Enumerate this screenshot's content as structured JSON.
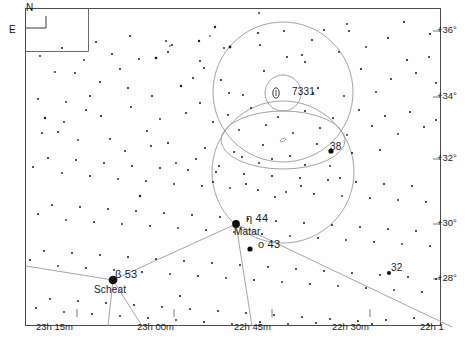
{
  "chart_data": {
    "type": "scatter",
    "xlabel": "Right Ascension",
    "ylabel": "Declination",
    "grid": false,
    "legend": "none",
    "x_ticks": [
      {
        "label": "23h 15m",
        "x": 63
      },
      {
        "label": "23h 00m",
        "x": 167
      },
      {
        "label": "22h 45m",
        "x": 265
      },
      {
        "label": "22h 30m",
        "x": 362
      },
      {
        "label": "22h 1",
        "x": 443
      }
    ],
    "y_ticks": [
      {
        "label": "+36°",
        "y": 27
      },
      {
        "label": "+34°",
        "y": 93
      },
      {
        "label": "+32°",
        "y": 155
      },
      {
        "label": "+30°",
        "y": 220
      },
      {
        "label": "+28°",
        "y": 275
      }
    ],
    "annotations": [
      {
        "name": "ngc-7331",
        "label": "7331",
        "x": 292,
        "y": 93,
        "kind": "galaxy"
      },
      {
        "name": "star-38",
        "label": "38",
        "x": 336,
        "y": 148,
        "kind": "star"
      },
      {
        "name": "star-eta-44",
        "label": "η  44",
        "x": 252,
        "y": 219,
        "kind": "star"
      },
      {
        "name": "star-matar",
        "label": "Matar",
        "x": 240,
        "y": 233,
        "kind": "proper-name"
      },
      {
        "name": "star-omicron-43",
        "label": "ο  43",
        "x": 263,
        "y": 245,
        "kind": "star"
      },
      {
        "name": "star-beta-53",
        "label": "β  53",
        "x": 120,
        "y": 275,
        "kind": "star"
      },
      {
        "name": "star-scheat",
        "label": "Scheat",
        "x": 98,
        "y": 292,
        "kind": "proper-name"
      },
      {
        "name": "star-32",
        "label": "32",
        "x": 396,
        "y": 269,
        "kind": "star"
      }
    ],
    "fov_circles": [
      {
        "name": "outer-circle-upper",
        "cx": 283,
        "cy": 92,
        "r": 70
      },
      {
        "name": "inner-circle-ngc7331",
        "cx": 283,
        "cy": 93,
        "r": 18
      },
      {
        "name": "outer-circle-lower",
        "cx": 283,
        "cy": 172,
        "r": 71
      },
      {
        "name": "ellipse-field",
        "cx": 283,
        "cy": 140,
        "rx": 62,
        "ry": 29
      }
    ],
    "named_stars": [
      {
        "name": "NGC 7331",
        "x": 283,
        "y": 93,
        "mag": 9.5,
        "type": "galaxy"
      },
      {
        "name": "38 Peg",
        "x": 331,
        "y": 151,
        "mag": 5.6,
        "type": "star"
      },
      {
        "name": "eta Peg / Matar / 44 Peg",
        "x": 236,
        "y": 224,
        "mag": 2.9,
        "type": "star"
      },
      {
        "name": "omicron Peg / 43 Peg",
        "x": 250,
        "y": 249,
        "mag": 4.8,
        "type": "star"
      },
      {
        "name": "beta Peg / Scheat / 53 Peg",
        "x": 113,
        "y": 280,
        "mag": 2.4,
        "type": "star"
      },
      {
        "name": "32 Peg",
        "x": 389,
        "y": 273,
        "mag": 4.8,
        "type": "star"
      }
    ]
  },
  "compass": {
    "north_label": "N",
    "east_label": "E"
  },
  "stars": [
    [
      215,
      27,
      1.2
    ],
    [
      258,
      33,
      1.1
    ],
    [
      324,
      30,
      1.0
    ],
    [
      404,
      22,
      1.1
    ],
    [
      444,
      26,
      1.0
    ],
    [
      519,
      28,
      0.9
    ],
    [
      224,
      48,
      0.9
    ],
    [
      260,
      45,
      1.0
    ],
    [
      210,
      36,
      0.8
    ],
    [
      388,
      38,
      1.1
    ],
    [
      347,
      24,
      0.9
    ],
    [
      156,
      58,
      1.3
    ],
    [
      139,
      59,
      1.0
    ],
    [
      302,
      55,
      1.0
    ],
    [
      339,
      52,
      0.9
    ],
    [
      430,
      34,
      1.1
    ],
    [
      204,
      68,
      1.0
    ],
    [
      264,
      71,
      1.0
    ],
    [
      366,
      47,
      0.9
    ],
    [
      259,
      13,
      0.9
    ],
    [
      193,
      78,
      1.0
    ],
    [
      181,
      86,
      1.2
    ],
    [
      172,
      45,
      1.0
    ],
    [
      253,
      8,
      0.9
    ],
    [
      23,
      71,
      1.2
    ],
    [
      75,
      73,
      1.0
    ],
    [
      120,
      69,
      1.0
    ],
    [
      55,
      72,
      0.9
    ],
    [
      199,
      41,
      1.2
    ],
    [
      166,
      41,
      0.9
    ],
    [
      168,
      52,
      1.0
    ],
    [
      170,
      46,
      0.8
    ],
    [
      229,
      93,
      1.0
    ],
    [
      243,
      95,
      1.0
    ],
    [
      287,
      57,
      1.0
    ],
    [
      305,
      62,
      1.0
    ],
    [
      318,
      88,
      1.1
    ],
    [
      313,
      93,
      1.0
    ],
    [
      344,
      96,
      0.9
    ],
    [
      349,
      31,
      1.0
    ],
    [
      361,
      69,
      1.1
    ],
    [
      376,
      92,
      0.9
    ],
    [
      391,
      79,
      1.0
    ],
    [
      407,
      60,
      1.1
    ],
    [
      416,
      73,
      1.0
    ],
    [
      429,
      57,
      1.0
    ],
    [
      440,
      60,
      0.9
    ],
    [
      446,
      119,
      2.2
    ],
    [
      448,
      58,
      1.2
    ],
    [
      454,
      44,
      0.9
    ],
    [
      436,
      83,
      1.0
    ],
    [
      444,
      91,
      1.0
    ],
    [
      441,
      100,
      0.9
    ],
    [
      22,
      72,
      1.1
    ],
    [
      38,
      99,
      1.0
    ],
    [
      66,
      102,
      0.9
    ],
    [
      90,
      96,
      1.0
    ],
    [
      101,
      116,
      1.1
    ],
    [
      45,
      118,
      1.2
    ],
    [
      58,
      132,
      1.0
    ],
    [
      78,
      140,
      0.9
    ],
    [
      110,
      139,
      1.0
    ],
    [
      131,
      107,
      1.0
    ],
    [
      147,
      131,
      1.0
    ],
    [
      160,
      119,
      0.9
    ],
    [
      186,
      113,
      1.0
    ],
    [
      200,
      103,
      1.0
    ],
    [
      213,
      122,
      1.0
    ],
    [
      228,
      115,
      1.0
    ],
    [
      239,
      130,
      0.9
    ],
    [
      251,
      108,
      1.0
    ],
    [
      266,
      125,
      1.0
    ],
    [
      278,
      117,
      1.0
    ],
    [
      293,
      133,
      0.9
    ],
    [
      305,
      111,
      1.0
    ],
    [
      320,
      128,
      1.0
    ],
    [
      333,
      118,
      1.0
    ],
    [
      347,
      135,
      0.9
    ],
    [
      359,
      110,
      1.0
    ],
    [
      372,
      126,
      1.0
    ],
    [
      385,
      116,
      1.0
    ],
    [
      398,
      134,
      0.9
    ],
    [
      410,
      112,
      1.0
    ],
    [
      424,
      127,
      1.0
    ],
    [
      436,
      120,
      1.0
    ],
    [
      19,
      152,
      1.0
    ],
    [
      33,
      167,
      1.0
    ],
    [
      48,
      158,
      1.0
    ],
    [
      62,
      173,
      0.9
    ],
    [
      76,
      160,
      1.0
    ],
    [
      90,
      176,
      1.0
    ],
    [
      104,
      163,
      1.0
    ],
    [
      118,
      179,
      0.9
    ],
    [
      132,
      166,
      1.0
    ],
    [
      146,
      181,
      1.0
    ],
    [
      160,
      168,
      1.0
    ],
    [
      174,
      184,
      0.9
    ],
    [
      188,
      170,
      1.0
    ],
    [
      202,
      186,
      1.0
    ],
    [
      216,
      172,
      1.0
    ],
    [
      230,
      188,
      0.9
    ],
    [
      244,
      174,
      1.0
    ],
    [
      258,
      190,
      1.0
    ],
    [
      272,
      176,
      1.0
    ],
    [
      286,
      192,
      0.9
    ],
    [
      300,
      178,
      1.0
    ],
    [
      314,
      194,
      1.0
    ],
    [
      328,
      180,
      1.0
    ],
    [
      342,
      196,
      0.9
    ],
    [
      356,
      182,
      1.0
    ],
    [
      370,
      198,
      1.0
    ],
    [
      384,
      184,
      1.0
    ],
    [
      398,
      200,
      0.9
    ],
    [
      412,
      186,
      1.0
    ],
    [
      426,
      202,
      1.0
    ],
    [
      440,
      188,
      1.0
    ],
    [
      452,
      199,
      0.9
    ],
    [
      24,
      199,
      1.0
    ],
    [
      38,
      214,
      1.0
    ],
    [
      52,
      205,
      1.0
    ],
    [
      66,
      220,
      0.9
    ],
    [
      80,
      207,
      1.0
    ],
    [
      94,
      222,
      1.0
    ],
    [
      108,
      209,
      1.0
    ],
    [
      122,
      224,
      0.9
    ],
    [
      136,
      211,
      1.0
    ],
    [
      150,
      226,
      1.0
    ],
    [
      164,
      213,
      1.0
    ],
    [
      178,
      228,
      0.9
    ],
    [
      192,
      215,
      1.0
    ],
    [
      206,
      230,
      1.0
    ],
    [
      220,
      217,
      1.0
    ],
    [
      234,
      232,
      0.9
    ],
    [
      248,
      219,
      1.0
    ],
    [
      262,
      234,
      1.0
    ],
    [
      276,
      221,
      1.0
    ],
    [
      290,
      236,
      0.9
    ],
    [
      304,
      223,
      1.0
    ],
    [
      318,
      238,
      1.0
    ],
    [
      332,
      225,
      1.0
    ],
    [
      346,
      240,
      0.9
    ],
    [
      360,
      227,
      1.0
    ],
    [
      374,
      242,
      1.0
    ],
    [
      388,
      229,
      1.0
    ],
    [
      402,
      244,
      0.9
    ],
    [
      416,
      231,
      1.0
    ],
    [
      430,
      246,
      1.0
    ],
    [
      444,
      233,
      1.0
    ],
    [
      16,
      245,
      1.0
    ],
    [
      30,
      260,
      1.0
    ],
    [
      44,
      251,
      1.0
    ],
    [
      58,
      266,
      0.9
    ],
    [
      72,
      253,
      1.0
    ],
    [
      86,
      268,
      1.0
    ],
    [
      100,
      255,
      1.0
    ],
    [
      114,
      270,
      0.9
    ],
    [
      128,
      257,
      1.0
    ],
    [
      142,
      272,
      1.0
    ],
    [
      156,
      259,
      1.0
    ],
    [
      170,
      274,
      0.9
    ],
    [
      184,
      261,
      1.0
    ],
    [
      198,
      276,
      1.0
    ],
    [
      212,
      263,
      1.0
    ],
    [
      226,
      278,
      0.9
    ],
    [
      240,
      265,
      1.0
    ],
    [
      254,
      280,
      1.0
    ],
    [
      268,
      267,
      1.0
    ],
    [
      282,
      282,
      0.9
    ],
    [
      296,
      269,
      1.0
    ],
    [
      310,
      284,
      1.0
    ],
    [
      324,
      271,
      1.0
    ],
    [
      338,
      286,
      0.9
    ],
    [
      352,
      273,
      1.0
    ],
    [
      366,
      288,
      1.0
    ],
    [
      380,
      275,
      1.0
    ],
    [
      394,
      290,
      0.9
    ],
    [
      408,
      277,
      1.0
    ],
    [
      422,
      292,
      1.0
    ],
    [
      436,
      279,
      1.0
    ],
    [
      450,
      290,
      0.9
    ],
    [
      22,
      296,
      1.0
    ],
    [
      36,
      308,
      1.0
    ],
    [
      50,
      299,
      1.0
    ],
    [
      64,
      312,
      0.9
    ],
    [
      78,
      301,
      1.0
    ],
    [
      92,
      314,
      1.0
    ],
    [
      106,
      303,
      1.0
    ],
    [
      120,
      316,
      0.9
    ],
    [
      134,
      305,
      1.0
    ],
    [
      148,
      318,
      1.0
    ],
    [
      162,
      307,
      1.0
    ],
    [
      176,
      320,
      0.9
    ],
    [
      190,
      309,
      1.0
    ],
    [
      204,
      322,
      1.0
    ],
    [
      218,
      311,
      1.0
    ],
    [
      232,
      324,
      0.9
    ],
    [
      246,
      313,
      1.0
    ],
    [
      260,
      322,
      1.0
    ],
    [
      274,
      315,
      1.0
    ],
    [
      288,
      324,
      0.9
    ],
    [
      302,
      317,
      1.0
    ],
    [
      316,
      323,
      1.0
    ],
    [
      330,
      319,
      1.0
    ],
    [
      344,
      325,
      0.9
    ],
    [
      358,
      321,
      1.0
    ],
    [
      372,
      324,
      1.0
    ],
    [
      386,
      320,
      1.0
    ],
    [
      400,
      325,
      0.9
    ],
    [
      414,
      318,
      1.0
    ],
    [
      428,
      324,
      1.0
    ],
    [
      442,
      316,
      1.0
    ],
    [
      140,
      196,
      1.2
    ],
    [
      275,
      197,
      1.0
    ],
    [
      180,
      296,
      1.1
    ],
    [
      230,
      47,
      1.4
    ],
    [
      284,
      31,
      1.0
    ],
    [
      312,
      40,
      1.0
    ],
    [
      168,
      143,
      1.1
    ],
    [
      151,
      146,
      1.0
    ],
    [
      125,
      151,
      1.0
    ],
    [
      205,
      148,
      1.0
    ],
    [
      234,
      152,
      1.0
    ],
    [
      263,
      145,
      1.0
    ],
    [
      290,
      156,
      1.0
    ],
    [
      317,
      144,
      1.0
    ],
    [
      352,
      153,
      1.1
    ],
    [
      380,
      150,
      1.0
    ],
    [
      242,
      157,
      1.0
    ],
    [
      259,
      163,
      0.9
    ],
    [
      272,
      159,
      1.0
    ],
    [
      219,
      166,
      1.0
    ],
    [
      196,
      159,
      1.0
    ],
    [
      176,
      163,
      0.9
    ],
    [
      305,
      165,
      1.0
    ],
    [
      330,
      166,
      0.9
    ],
    [
      213,
      182,
      1.0
    ],
    [
      246,
      184,
      1.0
    ],
    [
      301,
      186,
      1.0
    ],
    [
      340,
      178,
      1.0
    ],
    [
      96,
      42,
      1.0
    ],
    [
      112,
      54,
      1.0
    ],
    [
      84,
      60,
      0.9
    ],
    [
      130,
      36,
      1.0
    ],
    [
      62,
      48,
      1.0
    ],
    [
      40,
      56,
      0.9
    ],
    [
      100,
      82,
      1.0
    ],
    [
      128,
      88,
      1.0
    ],
    [
      152,
      96,
      1.0
    ],
    [
      86,
      110,
      1.0
    ],
    [
      64,
      122,
      0.9
    ],
    [
      42,
      133,
      1.0
    ],
    [
      26,
      113,
      1.0
    ],
    [
      16,
      126,
      0.9
    ],
    [
      200,
      61,
      1.0
    ],
    [
      221,
      80,
      1.0
    ]
  ]
}
